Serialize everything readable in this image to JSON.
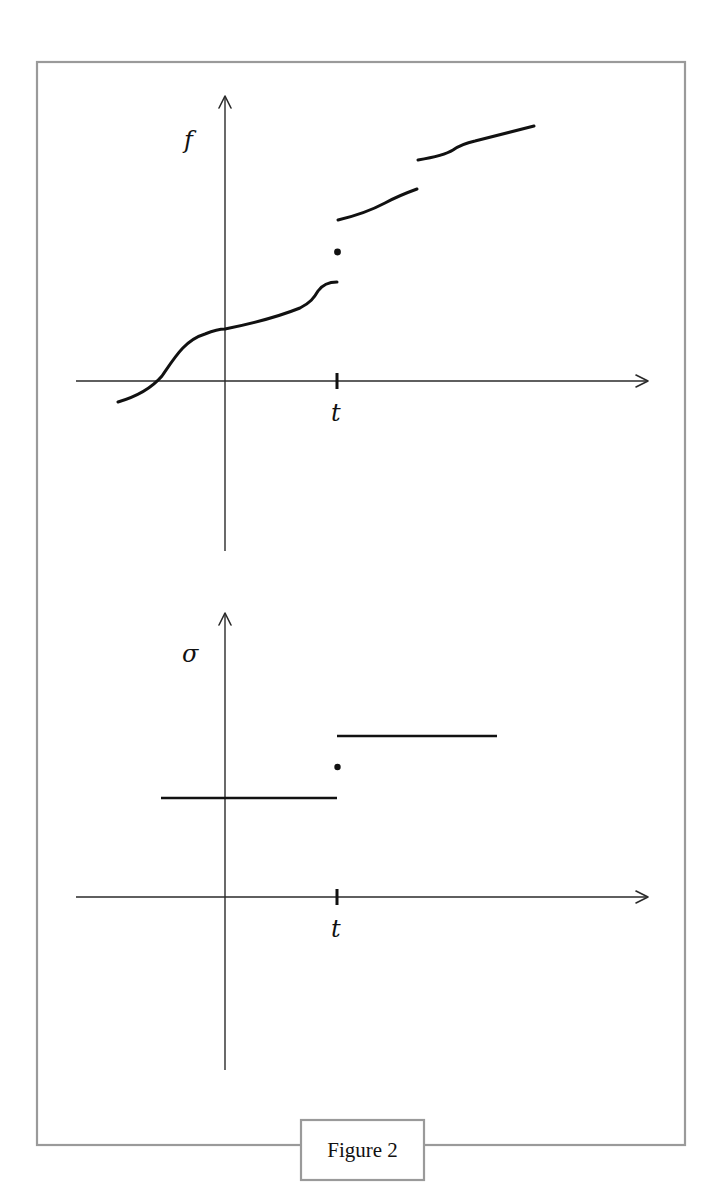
{
  "figure": {
    "caption": "Figure 2",
    "top_panel": {
      "y_label": "f",
      "x_tick_label": "t",
      "description": "Function f with jump discontinuities; at t the value is an isolated point between left and right limits"
    },
    "bottom_panel": {
      "y_label": "σ",
      "x_tick_label": "t",
      "description": "Step function sigma jumping at t with isolated value at t between the two levels"
    },
    "colors": {
      "frame": "#9a9a9a",
      "ink": "#111111",
      "background": "#ffffff"
    }
  }
}
